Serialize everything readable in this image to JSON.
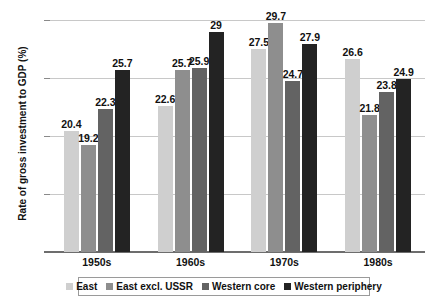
{
  "chart_data": {
    "type": "bar",
    "title": "",
    "subtitle": "",
    "xlabel": "",
    "ylabel": "Rate of gross investment to GDP (%)",
    "categories": [
      "1950s",
      "1960s",
      "1970s",
      "1980s"
    ],
    "series": [
      {
        "name": "East",
        "color": "#cfcfcf",
        "values": [
          20.4,
          22.6,
          27.5,
          26.6
        ]
      },
      {
        "name": "East excl. USSR",
        "color": "#8e8e8e",
        "values": [
          19.2,
          25.7,
          29.7,
          21.8
        ]
      },
      {
        "name": "Western core",
        "color": "#636363",
        "values": [
          22.3,
          25.9,
          24.7,
          23.8
        ]
      },
      {
        "name": "Western periphery",
        "color": "#232323",
        "values": [
          25.7,
          29.0,
          27.9,
          24.9
        ]
      }
    ],
    "value_labels": [
      [
        "20.4",
        "19.2",
        "22.3",
        "25.7"
      ],
      [
        "22.6",
        "25.7",
        "25.9",
        "29"
      ],
      [
        "27.5",
        "29.7",
        "24.7",
        "27.9"
      ],
      [
        "26.6",
        "21.8",
        "23.8",
        "24.9"
      ]
    ],
    "ylim": [
      10,
      30
    ],
    "yticks": [
      10,
      15,
      20,
      25,
      30
    ],
    "ytick_labels": [
      "10",
      "15",
      "20",
      "25",
      "30"
    ],
    "grid": true,
    "legend_position": "bottom",
    "legend_entries": [
      "East",
      "East excl. USSR",
      "Western core",
      "Western periphery"
    ]
  }
}
